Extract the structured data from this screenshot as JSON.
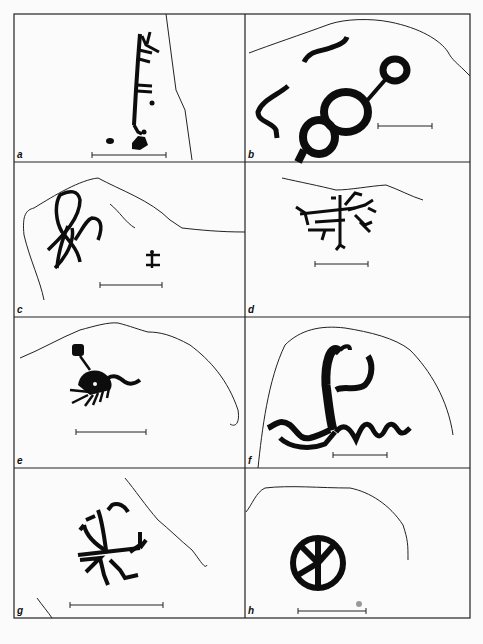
{
  "figure": {
    "type": "petroglyph-plate",
    "panels": [
      {
        "id": "a",
        "label": "a",
        "description": "Vertical comb-like figure with horizontal strokes, branching top, small dots near base; rock edge line at right",
        "has_scale_bar": true
      },
      {
        "id": "b",
        "label": "b",
        "description": "Chain of three rings joined by a line to a small loop, with two curved wavy strokes; rock outline at top",
        "has_scale_bar": true
      },
      {
        "id": "c",
        "label": "c",
        "description": "Interlaced looping curves and small cross-like figure; rock outline",
        "has_scale_bar": true
      },
      {
        "id": "d",
        "label": "d",
        "description": "Branching linear figure with multiple short strokes; rock outline at top",
        "has_scale_bar": true
      },
      {
        "id": "e",
        "label": "e",
        "description": "Figure with round head on a stalk, body with comb-like legs and a tail; rock outline",
        "has_scale_bar": true
      },
      {
        "id": "f",
        "label": "f",
        "description": "Figure with raised curved arms and long undulating wavy line; rock outline",
        "has_scale_bar": true
      },
      {
        "id": "g",
        "label": "g",
        "description": "Radiating branching figure with forked arms and legs; rock edge lines",
        "has_scale_bar": true
      },
      {
        "id": "h",
        "label": "h",
        "description": "Wheel / circle with radiating spokes; rock outline",
        "has_scale_bar": true
      }
    ]
  },
  "colors": {
    "ink": "#0d0d0d",
    "paper": "#fbfbfb",
    "frame": "#222222"
  }
}
